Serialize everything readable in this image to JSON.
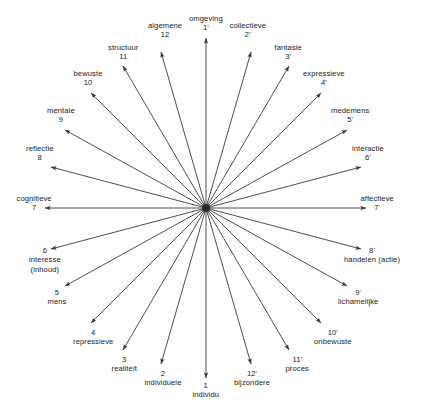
{
  "diagram": {
    "type": "radial-star",
    "title": "",
    "background_color": "#ffffff",
    "line_color": "#3a3a3a",
    "text_color": "#1a1a1a",
    "hub": {
      "cx": 206,
      "cy": 208,
      "r": 4,
      "label": "center-hub"
    },
    "spoke_count": 24,
    "spokes": [
      {
        "id": "spoke-1",
        "number": "1",
        "name": "individu",
        "angle_deg": 90,
        "tip_x": 206,
        "tip_y": 378,
        "label_x": 206,
        "label_y": 381,
        "order": "number-first"
      },
      {
        "id": "spoke-2",
        "number": "2",
        "name": "individuele",
        "angle_deg": 105,
        "tip_x": 161,
        "tip_y": 364,
        "label_x": 163,
        "label_y": 369,
        "order": "number-first"
      },
      {
        "id": "spoke-3",
        "number": "3",
        "name": "realiteit",
        "angle_deg": 120,
        "tip_x": 123,
        "tip_y": 350,
        "label_x": 124,
        "label_y": 355,
        "order": "number-first"
      },
      {
        "id": "spoke-4",
        "number": "4",
        "name": "repressieve",
        "angle_deg": 135,
        "tip_x": 91,
        "tip_y": 323,
        "label_x": 93,
        "label_y": 328,
        "order": "number-first"
      },
      {
        "id": "spoke-5",
        "number": "5",
        "name": "mens",
        "angle_deg": 150,
        "tip_x": 65,
        "tip_y": 286,
        "label_x": 57,
        "label_y": 288,
        "order": "number-first"
      },
      {
        "id": "spoke-6",
        "number": "6",
        "name": "interesse\n(inhoud)",
        "angle_deg": 165,
        "tip_x": 51,
        "tip_y": 249,
        "label_x": 45,
        "label_y": 246,
        "order": "number-first"
      },
      {
        "id": "spoke-7",
        "number": "7",
        "name": "cognitieve",
        "angle_deg": 180,
        "tip_x": 45,
        "tip_y": 208,
        "label_x": 34,
        "label_y": 194,
        "order": "name-first"
      },
      {
        "id": "spoke-8",
        "number": "8",
        "name": "reflectie",
        "angle_deg": 195,
        "tip_x": 51,
        "tip_y": 167,
        "label_x": 40,
        "label_y": 144,
        "order": "name-first"
      },
      {
        "id": "spoke-9",
        "number": "9",
        "name": "mentale",
        "angle_deg": 210,
        "tip_x": 65,
        "tip_y": 130,
        "label_x": 61,
        "label_y": 106,
        "order": "name-first"
      },
      {
        "id": "spoke-10",
        "number": "10",
        "name": "bewuste",
        "angle_deg": 225,
        "tip_x": 91,
        "tip_y": 93,
        "label_x": 88,
        "label_y": 69,
        "order": "name-first"
      },
      {
        "id": "spoke-11",
        "number": "11",
        "name": "structuur",
        "angle_deg": 240,
        "tip_x": 123,
        "tip_y": 66,
        "label_x": 123,
        "label_y": 43,
        "order": "name-first"
      },
      {
        "id": "spoke-12",
        "number": "12",
        "name": "algemene",
        "angle_deg": 255,
        "tip_x": 161,
        "tip_y": 52,
        "label_x": 165,
        "label_y": 21,
        "order": "name-first"
      },
      {
        "id": "spoke-1p",
        "number": "1'",
        "name": "omgeving",
        "angle_deg": 270,
        "tip_x": 206,
        "tip_y": 38,
        "label_x": 206,
        "label_y": 14,
        "order": "name-first"
      },
      {
        "id": "spoke-2p",
        "number": "2'",
        "name": "collectieve",
        "angle_deg": 285,
        "tip_x": 251,
        "tip_y": 52,
        "label_x": 248,
        "label_y": 21,
        "order": "name-first"
      },
      {
        "id": "spoke-3p",
        "number": "3'",
        "name": "fantasie",
        "angle_deg": 300,
        "tip_x": 289,
        "tip_y": 66,
        "label_x": 288,
        "label_y": 43,
        "order": "name-first"
      },
      {
        "id": "spoke-4p",
        "number": "4'",
        "name": "expressieve",
        "angle_deg": 315,
        "tip_x": 321,
        "tip_y": 93,
        "label_x": 324,
        "label_y": 69,
        "order": "name-first"
      },
      {
        "id": "spoke-5p",
        "number": "5'",
        "name": "medemens",
        "angle_deg": 330,
        "tip_x": 347,
        "tip_y": 130,
        "label_x": 350,
        "label_y": 106,
        "order": "name-first"
      },
      {
        "id": "spoke-6p",
        "number": "6'",
        "name": "interactie",
        "angle_deg": 345,
        "tip_x": 361,
        "tip_y": 167,
        "label_x": 368,
        "label_y": 144,
        "order": "name-first"
      },
      {
        "id": "spoke-7p",
        "number": "7'",
        "name": "affectieve",
        "angle_deg": 0,
        "tip_x": 366,
        "tip_y": 208,
        "label_x": 377,
        "label_y": 194,
        "order": "name-first"
      },
      {
        "id": "spoke-8p",
        "number": "8'",
        "name": "handelen (actie)",
        "angle_deg": 15,
        "tip_x": 361,
        "tip_y": 249,
        "label_x": 372,
        "label_y": 246,
        "order": "number-first"
      },
      {
        "id": "spoke-9p",
        "number": "9'",
        "name": "lichamelijke",
        "angle_deg": 30,
        "tip_x": 347,
        "tip_y": 286,
        "label_x": 358,
        "label_y": 288,
        "order": "number-first"
      },
      {
        "id": "spoke-10p",
        "number": "10'",
        "name": "onbewuste",
        "angle_deg": 45,
        "tip_x": 321,
        "tip_y": 323,
        "label_x": 333,
        "label_y": 328,
        "order": "number-first"
      },
      {
        "id": "spoke-11p",
        "number": "11'",
        "name": "proces",
        "angle_deg": 60,
        "tip_x": 289,
        "tip_y": 350,
        "label_x": 297,
        "label_y": 355,
        "order": "number-first"
      },
      {
        "id": "spoke-12p",
        "number": "12'",
        "name": "bijzondere",
        "angle_deg": 75,
        "tip_x": 251,
        "tip_y": 364,
        "label_x": 252,
        "label_y": 369,
        "order": "number-first"
      }
    ]
  }
}
